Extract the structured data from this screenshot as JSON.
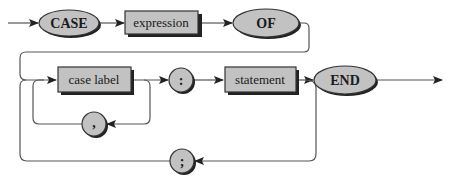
{
  "diagram": {
    "colors": {
      "node_fill": "#c2c2c2",
      "node_stroke": "#333333",
      "shadow": "#222222",
      "line": "#555555",
      "text": "#1a1a1a",
      "background": "#ffffff"
    },
    "nodes": {
      "case_kw": {
        "label": "CASE",
        "type": "terminal-keyword"
      },
      "expression": {
        "label": "expression",
        "type": "nonterminal"
      },
      "of_kw": {
        "label": "OF",
        "type": "terminal-keyword"
      },
      "case_label": {
        "label": "case label",
        "type": "nonterminal"
      },
      "colon": {
        "label": ":",
        "type": "terminal-symbol"
      },
      "statement": {
        "label": "statement",
        "type": "nonterminal"
      },
      "end_kw": {
        "label": "END",
        "type": "terminal-keyword"
      },
      "comma": {
        "label": ",",
        "type": "terminal-symbol"
      },
      "semicolon": {
        "label": ";",
        "type": "terminal-symbol"
      }
    },
    "edges": [
      {
        "from": "start",
        "to": "case_kw"
      },
      {
        "from": "case_kw",
        "to": "expression"
      },
      {
        "from": "expression",
        "to": "of_kw"
      },
      {
        "from": "of_kw",
        "to": "case_label"
      },
      {
        "from": "case_label",
        "to": "colon"
      },
      {
        "from": "case_label",
        "to": "comma",
        "kind": "loop"
      },
      {
        "from": "comma",
        "to": "case_label",
        "kind": "loop"
      },
      {
        "from": "colon",
        "to": "statement"
      },
      {
        "from": "statement",
        "to": "end_kw"
      },
      {
        "from": "statement",
        "to": "semicolon",
        "kind": "loop"
      },
      {
        "from": "semicolon",
        "to": "case_label",
        "kind": "loop"
      },
      {
        "from": "end_kw",
        "to": "exit"
      }
    ]
  }
}
